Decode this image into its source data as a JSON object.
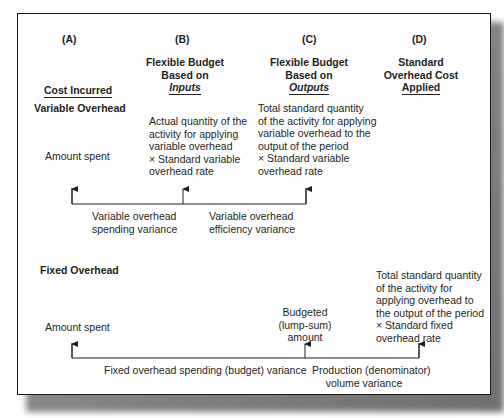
{
  "columns": [
    {
      "letter": "(A)",
      "title_lines": [],
      "underlined": "Cost Incurred"
    },
    {
      "letter": "(B)",
      "title_lines": [
        "Flexible Budget",
        "Based on"
      ],
      "underlined": "Inputs"
    },
    {
      "letter": "(C)",
      "title_lines": [
        "Flexible Budget",
        "Based on"
      ],
      "underlined": "Outputs"
    },
    {
      "letter": "(D)",
      "title_lines": [
        "Standard",
        "Overhead Cost"
      ],
      "underlined": "Applied"
    }
  ],
  "variable": {
    "section_title": "Variable Overhead",
    "a_text": "Amount spent",
    "b_lines": [
      "Actual quantity of the",
      "activity for applying",
      "variable overhead",
      "× Standard variable",
      "overhead rate"
    ],
    "c_lines": [
      "Total standard quantity",
      "of the activity for applying",
      "variable overhead to the",
      "output of the period",
      "× Standard variable",
      "overhead rate"
    ],
    "variances": [
      {
        "lines": [
          "Variable overhead",
          "spending variance"
        ]
      },
      {
        "lines": [
          "Variable overhead",
          "efficiency variance"
        ]
      }
    ]
  },
  "fixed": {
    "section_title": "Fixed Overhead",
    "a_text": "Amount spent",
    "c_lines": [
      "Budgeted",
      "(lump-sum)",
      "amount"
    ],
    "d_lines": [
      "Total standard quantity",
      "of the activity for",
      "applying overhead to",
      "the output of the period",
      "× Standard fixed",
      "overhead rate"
    ],
    "variances": [
      {
        "lines": [
          "Fixed overhead spending (budget) variance"
        ]
      },
      {
        "lines": [
          "Production (denominator)",
          "volume variance"
        ]
      }
    ]
  }
}
